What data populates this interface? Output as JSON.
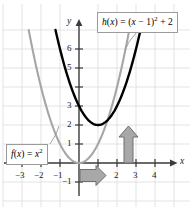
{
  "figure": {
    "background_color": "#ffffff",
    "grid_color": "#dcdcdc",
    "axis_color": "#3a3a3a",
    "curve_h_color": "#000000",
    "curve_f_color": "#a6a6a6",
    "arrow_fill": "#a8a8a8",
    "arrow_stroke": "#6e6e6e"
  },
  "axes": {
    "x_axis_name": "x",
    "y_axis_name": "y",
    "x_ticks": [
      {
        "value": -3,
        "label": "−3"
      },
      {
        "value": -2,
        "label": "−2"
      },
      {
        "value": -1,
        "label": "−1"
      },
      {
        "value": 1,
        "label": ""
      },
      {
        "value": 2,
        "label": "2"
      },
      {
        "value": 3,
        "label": "3"
      },
      {
        "value": 4,
        "label": "4"
      }
    ],
    "y_ticks": [
      {
        "value": -1,
        "label": "−1"
      },
      {
        "value": 1,
        "label": "1"
      },
      {
        "value": 2,
        "label": "2"
      },
      {
        "value": 3,
        "label": "3"
      },
      {
        "value": 4,
        "label": ""
      },
      {
        "value": 5,
        "label": "5"
      },
      {
        "value": 6,
        "label": "6"
      }
    ],
    "xlim": [
      -3.9,
      4.8
    ],
    "ylim": [
      -1.7,
      7.0
    ],
    "grid": true
  },
  "callouts": {
    "h_label": {
      "name": "h",
      "expression": "h(x) = (x − 1)² + 2",
      "parts": {
        "fn": "h",
        "arg_open": "(",
        "var1": "x",
        "arg_close": ")",
        "equals": " = (",
        "var2": "x",
        "minus_one": " − 1)",
        "power": "2",
        "plus_two": " + 2"
      }
    },
    "f_label": {
      "name": "f",
      "expression": "f(x) = x²",
      "parts": {
        "fn": "f",
        "arg_open": "(",
        "var1": "x",
        "arg_close": ")",
        "equals": " = ",
        "var2": "x",
        "power": "2"
      }
    }
  },
  "annotations": {
    "horizontal_shift_arrow": {
      "meaning": "horizontal translation right 1 unit",
      "from": [
        0,
        -0.25
      ],
      "to": [
        1.45,
        -0.25
      ]
    },
    "vertical_shift_arrow": {
      "meaning": "vertical translation up 2 units",
      "from": [
        2.55,
        0
      ],
      "to": [
        2.55,
        1.9
      ]
    }
  },
  "chart_data": {
    "type": "line",
    "title": "",
    "xlabel": "x",
    "ylabel": "y",
    "xlim": [
      -3.9,
      4.8
    ],
    "ylim": [
      -1.7,
      7.0
    ],
    "grid": true,
    "legend": "callout-labels",
    "series": [
      {
        "name": "f(x) = x²",
        "color": "#a6a6a6",
        "vertex": [
          0,
          0
        ],
        "equation": "y = x^2",
        "x": [
          -2.65,
          -2.4,
          -2.0,
          -1.6,
          -1.2,
          -0.8,
          -0.4,
          0,
          0.4,
          0.8,
          1.2,
          1.6,
          2.0,
          2.4,
          2.65
        ],
        "y": [
          7.02,
          5.76,
          4.0,
          2.56,
          1.44,
          0.64,
          0.16,
          0,
          0.16,
          0.64,
          1.44,
          2.56,
          4.0,
          5.76,
          7.02
        ]
      },
      {
        "name": "h(x) = (x − 1)² + 2",
        "color": "#000000",
        "vertex": [
          1,
          2
        ],
        "equation": "y = (x-1)^2 + 2",
        "x": [
          -1.25,
          -1.0,
          -0.6,
          -0.2,
          0.2,
          0.6,
          1.0,
          1.4,
          1.8,
          2.2,
          2.6,
          3.0,
          3.25
        ],
        "y": [
          7.06,
          6.0,
          4.56,
          3.44,
          2.64,
          2.16,
          2.0,
          2.16,
          2.64,
          3.44,
          4.56,
          6.0,
          7.06
        ]
      }
    ]
  }
}
